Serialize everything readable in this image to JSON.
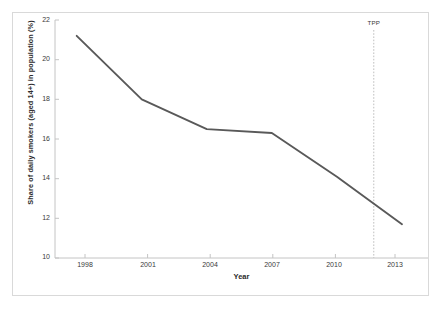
{
  "chart_data": {
    "type": "line",
    "title": "",
    "subtitle": "",
    "xlabel": "Year",
    "ylabel": "Share of daily smokers (aged 14+) in population (%)",
    "x": [
      1998,
      2001,
      2004,
      2007,
      2010,
      2013
    ],
    "values": [
      21.2,
      18.0,
      16.5,
      16.3,
      14.1,
      11.7
    ],
    "series": [
      {
        "name": "Share of daily smokers",
        "values": [
          21.2,
          18.0,
          16.5,
          16.3,
          14.1,
          11.7
        ],
        "color": "#595959"
      }
    ],
    "xlim": [
      1997.0,
      2014.2
    ],
    "ylim": [
      10,
      22
    ],
    "y_ticks": [
      10,
      12,
      14,
      16,
      18,
      20,
      22
    ],
    "y_tick_labels": [
      "10",
      "12",
      "14",
      "16",
      "18",
      "20",
      "22"
    ],
    "x_ticks": [
      1998,
      2001,
      2004,
      2007,
      2010,
      2013
    ],
    "x_tick_labels": [
      "1998",
      "2001",
      "2004",
      "2007",
      "2010",
      "2013"
    ],
    "grid": false,
    "legend": false,
    "legend_position": "none",
    "markers": false,
    "annotations": [
      {
        "label": "TPP",
        "type": "vertical-dotted-line",
        "x": 2011.7,
        "color": "#bfbfbf"
      }
    ]
  },
  "figure": {
    "border_color": "#d9d9d9",
    "background": "#ffffff",
    "axis_color": "#bfbfbf",
    "tick_label_color": "#3a3a3a",
    "axis_title_color": "#2b2b2b"
  }
}
